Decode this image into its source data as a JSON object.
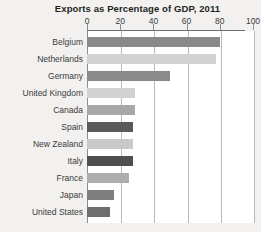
{
  "chart_data": {
    "type": "bar",
    "orientation": "horizontal",
    "title": "Exports as Percentage of GDP, 2011",
    "xlabel": "",
    "ylabel": "",
    "xlim": [
      0,
      100
    ],
    "xticks": [
      0,
      20,
      40,
      60,
      80,
      100
    ],
    "xticklabels": [
      "0",
      "20",
      "40",
      "60",
      "80",
      "100"
    ],
    "grid": "vertical",
    "legend": "none",
    "categories": [
      "Belgium",
      "Netherlands",
      "Germany",
      "United Kingdom",
      "Canada",
      "Spain",
      "New Zealand",
      "Italy",
      "France",
      "Japan",
      "United States"
    ],
    "values": [
      80,
      78,
      50,
      29,
      29,
      28,
      28,
      28,
      25,
      16,
      14
    ],
    "bar_colors": [
      "#8a8a8a",
      "#d2d2d2",
      "#8a8a8a",
      "#d2d2d2",
      "#a8a8a8",
      "#5a5a5a",
      "#c9c9c9",
      "#4f4f4f",
      "#aeaeae",
      "#7f7f7f",
      "#6e6e6e"
    ]
  },
  "colors": {
    "page_background": "#f2f1ef",
    "plot_background": "#ffffff",
    "gridline": "#b9b9b9",
    "axis": "#8d8d8d",
    "title_text": "#231f20",
    "label_text": "#3b3b3b"
  }
}
